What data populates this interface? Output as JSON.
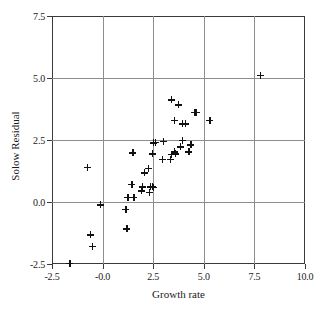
{
  "chart_data": {
    "type": "scatter",
    "title": "",
    "xlabel": "Growth rate",
    "ylabel": "Solow Residual",
    "xlim": [
      -2.5,
      10.0
    ],
    "ylim": [
      -2.5,
      7.5
    ],
    "xticks": [
      "-2.5",
      "-0.0",
      "2.5",
      "5.0",
      "7.5",
      "10.0"
    ],
    "xtick_values": [
      -2.5,
      0.0,
      2.5,
      5.0,
      7.5,
      10.0
    ],
    "yticks": [
      "7.5",
      "5.0",
      "2.5",
      "0.0",
      "-2.5"
    ],
    "ytick_values": [
      7.5,
      5.0,
      2.5,
      0.0,
      -2.5
    ],
    "grid": true,
    "grid_color": "#8d8d8d",
    "marker": "plus",
    "marker_color": "#111111",
    "legend": null,
    "points": [
      {
        "x": -1.62,
        "y": -2.48
      },
      {
        "x": -0.62,
        "y": -1.33
      },
      {
        "x": -0.52,
        "y": -1.78
      },
      {
        "x": -0.77,
        "y": 1.4
      },
      {
        "x": -0.1,
        "y": -0.12
      },
      {
        "x": 1.15,
        "y": -0.3
      },
      {
        "x": 1.25,
        "y": 0.18
      },
      {
        "x": 1.2,
        "y": -1.08
      },
      {
        "x": 1.45,
        "y": 0.72
      },
      {
        "x": 1.55,
        "y": 0.2
      },
      {
        "x": 1.5,
        "y": 1.98
      },
      {
        "x": 1.9,
        "y": 0.45
      },
      {
        "x": 1.95,
        "y": 0.62
      },
      {
        "x": 2.05,
        "y": 1.18
      },
      {
        "x": 2.3,
        "y": 0.38
      },
      {
        "x": 2.35,
        "y": 0.62
      },
      {
        "x": 2.45,
        "y": 0.62
      },
      {
        "x": 2.5,
        "y": 0.6
      },
      {
        "x": 2.25,
        "y": 1.35
      },
      {
        "x": 2.45,
        "y": 1.95
      },
      {
        "x": 2.5,
        "y": 2.38
      },
      {
        "x": 2.6,
        "y": 2.4
      },
      {
        "x": 2.95,
        "y": 1.72
      },
      {
        "x": 3.0,
        "y": 2.45
      },
      {
        "x": 3.35,
        "y": 1.72
      },
      {
        "x": 3.4,
        "y": 1.92
      },
      {
        "x": 3.55,
        "y": 2.02
      },
      {
        "x": 3.6,
        "y": 1.95
      },
      {
        "x": 3.85,
        "y": 2.22
      },
      {
        "x": 3.95,
        "y": 2.48
      },
      {
        "x": 4.25,
        "y": 2.02
      },
      {
        "x": 4.35,
        "y": 2.3
      },
      {
        "x": 3.4,
        "y": 4.12
      },
      {
        "x": 3.55,
        "y": 3.3
      },
      {
        "x": 3.75,
        "y": 3.92
      },
      {
        "x": 3.95,
        "y": 3.15
      },
      {
        "x": 4.1,
        "y": 3.15
      },
      {
        "x": 4.55,
        "y": 3.62
      },
      {
        "x": 4.62,
        "y": 3.62
      },
      {
        "x": 5.3,
        "y": 3.3
      },
      {
        "x": 7.78,
        "y": 5.1
      }
    ]
  }
}
